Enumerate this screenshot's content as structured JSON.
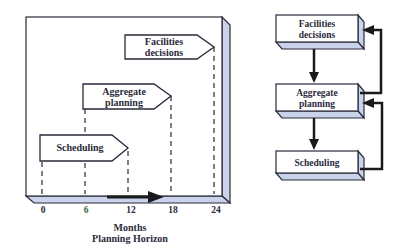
{
  "left_panel": {
    "arrows": [
      {
        "label_lines": [
          "Facilities",
          "decisions"
        ]
      },
      {
        "label_lines": [
          "Aggregate",
          "planning"
        ]
      },
      {
        "label_lines": [
          "Scheduling"
        ]
      }
    ],
    "axis": {
      "ticks": [
        "0",
        "6",
        "12",
        "18",
        "24"
      ],
      "tick_colors": [
        "#2a2a3a",
        "#2f6b3a",
        "#2a2a3a",
        "#2a2a3a",
        "#2a2a3a"
      ],
      "unit_label": "Months",
      "title": "Planning Horizon"
    }
  },
  "right_panel": {
    "boxes": [
      {
        "label_lines": [
          "Facilities",
          "decisions"
        ]
      },
      {
        "label_lines": [
          "Aggregate",
          "planning"
        ]
      },
      {
        "label_lines": [
          "Scheduling"
        ]
      }
    ]
  },
  "colors": {
    "panel_face": "#ffffff",
    "panel_side": "#c9d3ea",
    "stroke": "#2a2a3a",
    "text": "#2a2a3a"
  }
}
